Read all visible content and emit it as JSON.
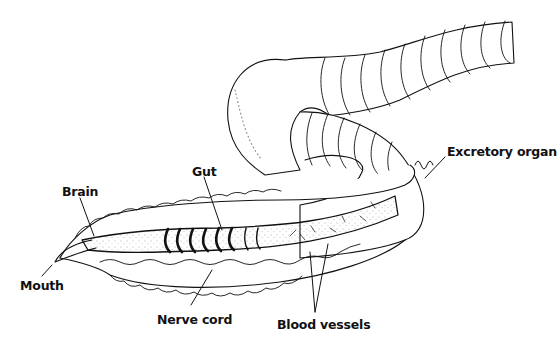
{
  "diagram": {
    "background": "#ffffff",
    "line_color": "#111111",
    "labels": [
      {
        "id": "brain",
        "text": "Brain",
        "x": 62,
        "y": 184
      },
      {
        "id": "gut",
        "text": "Gut",
        "x": 192,
        "y": 164
      },
      {
        "id": "mouth",
        "text": "Mouth",
        "x": 20,
        "y": 278
      },
      {
        "id": "nerve-cord",
        "text": "Nerve cord",
        "x": 157,
        "y": 312
      },
      {
        "id": "blood-vessels",
        "text": "Blood vessels",
        "x": 277,
        "y": 317
      },
      {
        "id": "excretory-organ",
        "text": "Excretory organ",
        "x": 447,
        "y": 144
      }
    ]
  }
}
